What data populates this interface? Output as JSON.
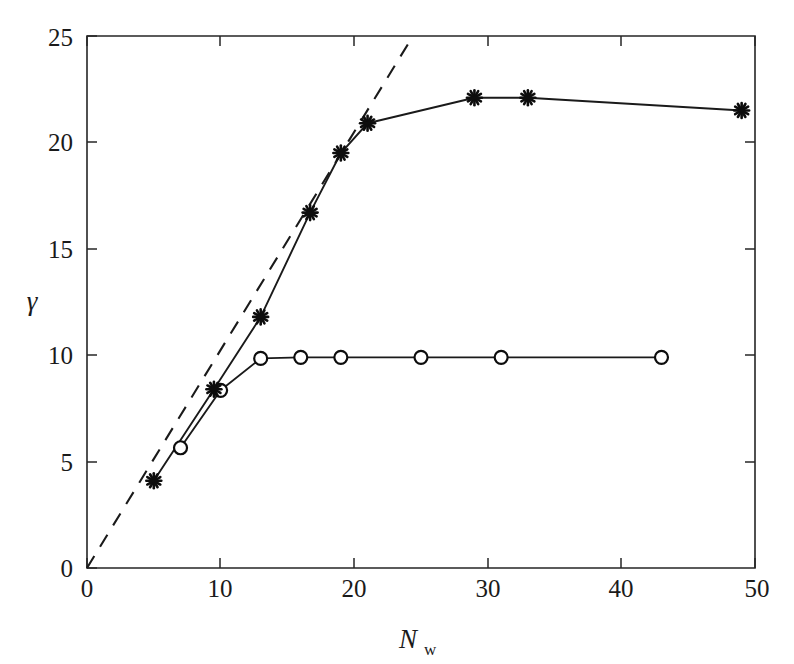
{
  "figure": {
    "header_text": "",
    "background_color": "#ffffff",
    "ink_color": "#1a1a1a"
  },
  "axes": {
    "x": {
      "label_main": "N",
      "label_sub": "w",
      "ticks": [
        "0",
        "10",
        "20",
        "30",
        "40",
        "50"
      ],
      "tick_values": [
        0,
        10,
        20,
        30,
        40,
        50
      ],
      "min": 0,
      "max": 50
    },
    "y": {
      "label_main": "γ",
      "ticks": [
        "0",
        "5",
        "10",
        "15",
        "20",
        "25"
      ],
      "tick_values": [
        0,
        5,
        10,
        15,
        20,
        25
      ],
      "min": 0,
      "max": 25
    }
  },
  "chart_data": {
    "type": "line",
    "title": "",
    "subtitle": "",
    "xlabel": "N_w",
    "ylabel": "γ",
    "xlim": [
      0,
      50
    ],
    "ylim": [
      0,
      25
    ],
    "grid": false,
    "legend": "none",
    "series": [
      {
        "name": "asterisk-series",
        "marker": "asterisk",
        "linestyle": "solid",
        "color": "#1a1a1a",
        "x": [
          5,
          9.5,
          13,
          16.7,
          19,
          21,
          29,
          33,
          49
        ],
        "y": [
          4.1,
          8.4,
          11.8,
          16.7,
          19.5,
          20.9,
          22.1,
          22.1,
          21.5
        ]
      },
      {
        "name": "circle-series",
        "marker": "circle",
        "linestyle": "solid",
        "color": "#1a1a1a",
        "x": [
          7,
          10,
          13,
          16,
          19,
          25,
          31,
          43
        ],
        "y": [
          5.65,
          8.35,
          9.85,
          9.9,
          9.9,
          9.9,
          9.9,
          9.9
        ]
      },
      {
        "name": "reference-dashed-line",
        "marker": "none",
        "linestyle": "dashed",
        "color": "#1a1a1a",
        "x": [
          0,
          24.4
        ],
        "y": [
          0,
          25
        ]
      }
    ]
  }
}
